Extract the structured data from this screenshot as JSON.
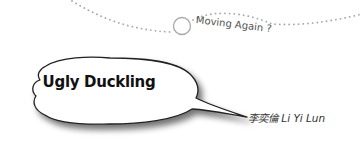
{
  "header": {
    "tagline": "Moving Again ?"
  },
  "bubble": {
    "title": "Ugly Duckling"
  },
  "author": {
    "name": "李奕倫 Li Yi Lun"
  },
  "colors": {
    "dots": "#a8a8a8",
    "bubble_fill": "#ffffff",
    "bubble_outline": "#222222",
    "text": "#111111"
  }
}
